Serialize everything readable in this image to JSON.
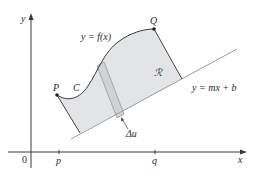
{
  "figure": {
    "axes": {
      "x_label": "x",
      "y_label": "y",
      "origin_label": "0",
      "ticks": [
        {
          "label": "p"
        },
        {
          "label": "q"
        }
      ]
    },
    "curve": {
      "label": "y = f(x)",
      "name_label": "C",
      "endpoints": [
        {
          "label": "P"
        },
        {
          "label": "Q"
        }
      ]
    },
    "line": {
      "label": "y = mx + b"
    },
    "region": {
      "label": "ℛ",
      "fill": "#e2e4e6"
    },
    "strip": {
      "label": "Δu",
      "fill": "#cfd3d6"
    },
    "colors": {
      "axis": "#3a3a3a",
      "curve": "#3a3a3a",
      "line": "#9a9a9a",
      "edges": "#444444",
      "point": "#222222"
    }
  }
}
